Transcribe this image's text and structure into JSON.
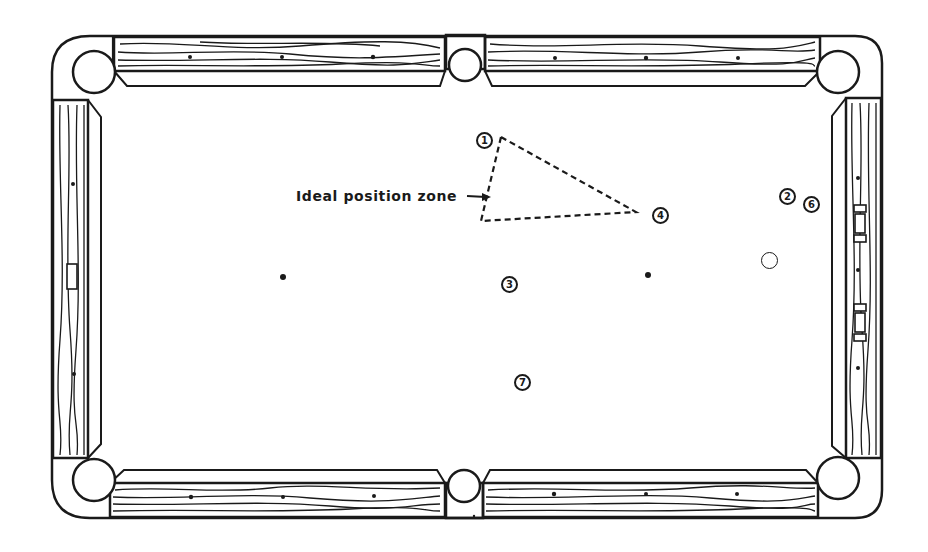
{
  "diagram": {
    "type": "pool-table-position-play",
    "annotation": {
      "label": "Ideal position zone",
      "arrow": "right-arrow",
      "zone_shape": "dashed-triangle"
    },
    "balls": [
      {
        "number": "1",
        "x": 484,
        "y": 140
      },
      {
        "number": "2",
        "x": 787,
        "y": 196
      },
      {
        "number": "6",
        "x": 811,
        "y": 204
      },
      {
        "number": "4",
        "x": 660,
        "y": 215
      },
      {
        "number": "3",
        "x": 509,
        "y": 284
      },
      {
        "number": "7",
        "x": 522,
        "y": 382
      }
    ],
    "cue_ball": {
      "x": 769,
      "y": 260
    },
    "spots": [
      {
        "name": "head-spot",
        "x": 283,
        "y": 277
      },
      {
        "name": "foot-spot",
        "x": 648,
        "y": 275
      }
    ],
    "pockets": [
      "top-left",
      "top-middle",
      "top-right",
      "bottom-left",
      "bottom-middle",
      "bottom-right"
    ],
    "colors": {
      "ink": "#1a1a1a",
      "paper": "#ffffff"
    }
  }
}
